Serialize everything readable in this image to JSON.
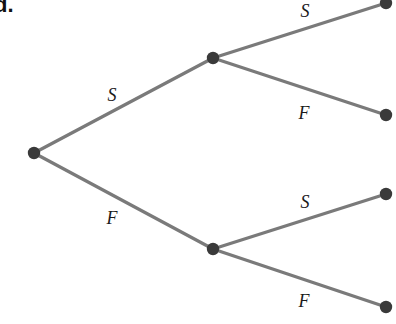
{
  "part_label": "d.",
  "colors": {
    "edge": "#7a7a7a",
    "node": "#3a3a3a",
    "label": "#1a1a1a"
  },
  "nodes": [
    {
      "id": "root",
      "x": 34,
      "y": 153
    },
    {
      "id": "S",
      "x": 213,
      "y": 58
    },
    {
      "id": "F",
      "x": 213,
      "y": 249
    },
    {
      "id": "SS",
      "x": 386,
      "y": 3
    },
    {
      "id": "SF",
      "x": 386,
      "y": 115
    },
    {
      "id": "FS",
      "x": 386,
      "y": 194
    },
    {
      "id": "FF",
      "x": 386,
      "y": 307
    }
  ],
  "edges": [
    {
      "from": "root",
      "to": "S",
      "label": "S",
      "label_x": 112,
      "label_y": 101
    },
    {
      "from": "root",
      "to": "F",
      "label": "F",
      "label_x": 112,
      "label_y": 224
    },
    {
      "from": "S",
      "to": "SS",
      "label": "S",
      "label_x": 305,
      "label_y": 17
    },
    {
      "from": "S",
      "to": "SF",
      "label": "F",
      "label_x": 304,
      "label_y": 119
    },
    {
      "from": "F",
      "to": "FS",
      "label": "S",
      "label_x": 305,
      "label_y": 208
    },
    {
      "from": "F",
      "to": "FF",
      "label": "F",
      "label_x": 304,
      "label_y": 307
    }
  ]
}
